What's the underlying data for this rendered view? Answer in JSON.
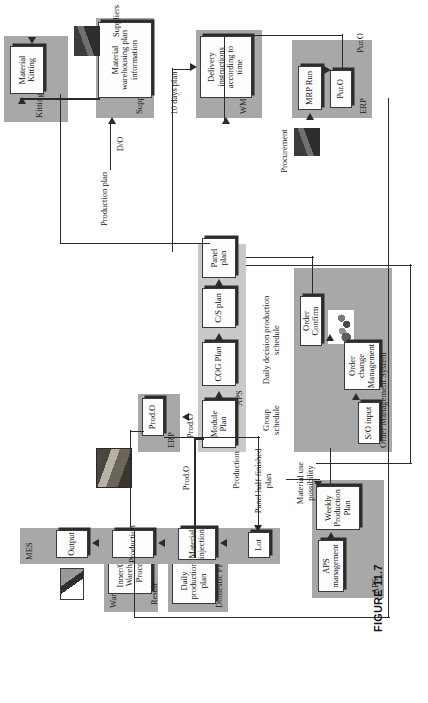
{
  "figure": {
    "caption": "FIGURE 11.7"
  },
  "groups": {
    "aps_system": {
      "label": "APS"
    },
    "domestic_pps": {
      "label": "Domestic PPS"
    },
    "warehousing": {
      "label": "Warehousing system"
    },
    "order_mgmt": {
      "label": "Order Management System"
    },
    "aps_band": {
      "label": "APS"
    },
    "erp_right": {
      "label": "ERP"
    },
    "mes": {
      "label": "MES"
    },
    "erp_left": {
      "label": "ERP"
    },
    "wms": {
      "label": "WMS"
    },
    "supply_coop": {
      "label": "Supply cooperation"
    },
    "kitting_system": {
      "label": "Kitting System"
    }
  },
  "boxes": {
    "aps_management": "APS management",
    "weekly_plan": "Weekly Production Plan",
    "daily_prod_plan": "Daily production plan",
    "warehousing_proc": "Inner/Outside Warehousing Processing",
    "order_confirm": "Order Confirm",
    "so_input": "S/O input",
    "order_change": "Order change Management",
    "panel_plan": "Panel plan",
    "cs_plan": "C/S plan",
    "cog_plan": "COG Plan",
    "module_plan": "Module Plan",
    "prod_o_erp": "Prod.O",
    "output": "Output",
    "production": "Production",
    "material_inject": "Material injection",
    "lot": "Lot",
    "mrp_run": "MRP Run",
    "pur_o_box": "Pur.O",
    "delivery_instr": "Delivery instructions according to time",
    "mat_wh_plan_info": "Material warehousing plan information",
    "material_kitting": "Material Kitting"
  },
  "flow_labels": {
    "material_use": "Material use possibility",
    "panel_half": "Panel half-finished plan",
    "daily_decision": "Daily decision production schedule",
    "prod_o_1": "Prod.O",
    "prod_o_2": "Prod.O",
    "production_1": "Production",
    "group_schedule": "Group schedule",
    "production_plan": "Production plan",
    "result": "Result",
    "procurement": "Procurement",
    "ten_days_plan": "10 days plan",
    "pur_o_flow": "Pur.O",
    "d_o_flow": "D/O",
    "suppliers": "Suppliers"
  },
  "clipart": {
    "sales_people": "people-group-icon",
    "procure_truck": "delivery-truck-icon",
    "mes_scanner": "barcode-scanner-icon",
    "machine_photo": "factory-machine-photo",
    "supplier_truck": "supplier-truck-icon"
  },
  "colors": {
    "group_fill": "#a8a8a8",
    "band_fill": "#c9c9c9",
    "box_fill": "#fdfdfd",
    "line": "#2b2b2b"
  }
}
